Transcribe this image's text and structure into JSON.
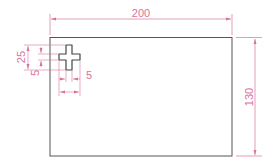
{
  "drawing": {
    "type": "technical-dimensioned-plate",
    "colors": {
      "outline": "#555555",
      "dimension": "#d9739a",
      "background": "#ffffff"
    },
    "plate": {
      "width_label": "200",
      "height_label": "130"
    },
    "cutout": {
      "shape": "cross",
      "dimensions": {
        "vertical_total": "25",
        "vertical_offset": "5",
        "arm_width": "5"
      }
    }
  }
}
